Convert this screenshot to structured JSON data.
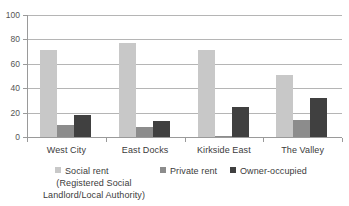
{
  "chart_data": {
    "type": "bar",
    "title": "",
    "subtitle": "",
    "xlabel": "",
    "ylabel": "",
    "ylim": [
      0,
      100
    ],
    "yticks": [
      0,
      20,
      40,
      60,
      80,
      100
    ],
    "ytick_labels": [
      "0",
      "20",
      "40",
      "60",
      "80",
      "100"
    ],
    "grid": true,
    "legend_position": "bottom",
    "categories": [
      "West City",
      "East Docks",
      "Kirkside East",
      "The Valley"
    ],
    "series": [
      {
        "name": "Social rent",
        "name_line2": "(Registered Social",
        "name_line3": "Landlord/Local Authority)",
        "color": "#c8c8c8",
        "values": [
          71,
          77,
          71,
          51
        ]
      },
      {
        "name": "Private rent",
        "color": "#8c8c8c",
        "values": [
          10,
          8,
          1,
          14
        ]
      },
      {
        "name": "Owner-occupied",
        "color": "#404040",
        "values": [
          18,
          13,
          25,
          32
        ]
      }
    ]
  },
  "axis": {
    "y_labels": [
      "100",
      "80",
      "60",
      "40",
      "20",
      "0"
    ]
  },
  "categories": {
    "c0": "West City",
    "c1": "East Docks",
    "c2": "Kirkside East",
    "c3": "The Valley"
  },
  "legend": {
    "s0_label": "Social rent",
    "s0_label_line2": "(Registered Social",
    "s0_label_line3": "Landlord/Local Authority)",
    "s1_label": "Private rent",
    "s2_label": "Owner-occupied"
  },
  "title_fragment": {
    "text": ""
  },
  "colors": {
    "social_rent": "#c8c8c8",
    "private_rent": "#8c8c8c",
    "owner_occupied": "#404040",
    "gridline": "#b5b5b5",
    "axis": "#9a9a9a",
    "text": "#3b3b3b"
  }
}
